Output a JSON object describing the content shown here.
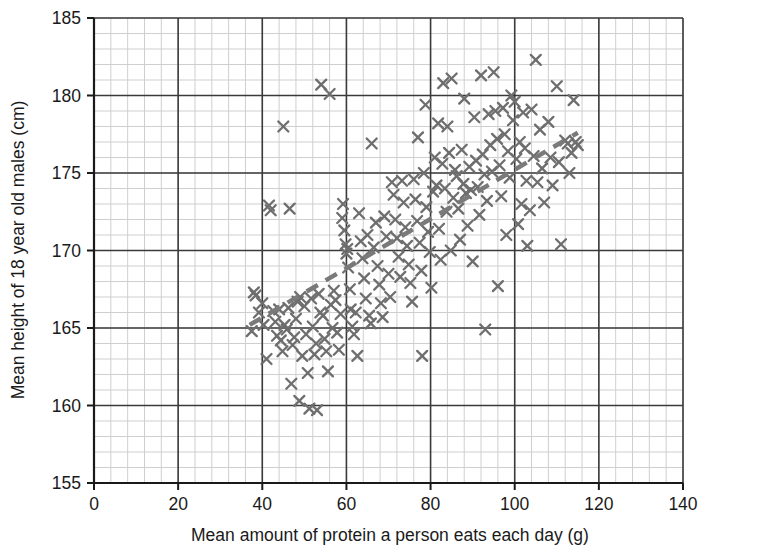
{
  "chart_data": {
    "type": "scatter",
    "title": "",
    "xlabel": "Mean amount of protein a person eats each day (g)",
    "ylabel": "Mean height of 18 year old males (cm)",
    "xlim": [
      0,
      140
    ],
    "ylim": [
      155,
      185
    ],
    "x_major_ticks": [
      0,
      20,
      40,
      60,
      80,
      100,
      120,
      140
    ],
    "y_major_ticks": [
      155,
      160,
      165,
      170,
      175,
      180,
      185
    ],
    "x_minor_step": 4,
    "y_minor_step": 1,
    "grid": true,
    "legend": "none",
    "marker": "x-cross",
    "marker_color": "#6e6e6e",
    "grid_major_color": "#3a3a3a",
    "grid_minor_color": "#cfcfcf",
    "axis_color": "#1a1a1a",
    "trend_line": {
      "style": "dashed",
      "color": "#7a7a7a",
      "width": 4.5,
      "x_start": 37,
      "y_start": 165.2,
      "x_end": 115,
      "y_end": 177.6
    },
    "points": [
      [
        37.5,
        164.8
      ],
      [
        38.0,
        167.3
      ],
      [
        38.4,
        167.1
      ],
      [
        39.2,
        166.0
      ],
      [
        40.0,
        166.6
      ],
      [
        40.3,
        165.2
      ],
      [
        41.0,
        163.0
      ],
      [
        41.6,
        172.9
      ],
      [
        42.0,
        172.6
      ],
      [
        42.6,
        166.1
      ],
      [
        43.1,
        165.4
      ],
      [
        43.5,
        164.5
      ],
      [
        44.0,
        166.2
      ],
      [
        44.4,
        164.2
      ],
      [
        44.8,
        163.5
      ],
      [
        45.0,
        178.0
      ],
      [
        45.3,
        165.2
      ],
      [
        45.8,
        164.9
      ],
      [
        46.2,
        166.3
      ],
      [
        46.5,
        172.7
      ],
      [
        46.9,
        161.4
      ],
      [
        47.2,
        163.9
      ],
      [
        47.6,
        164.4
      ],
      [
        48.0,
        165.6
      ],
      [
        48.4,
        166.7
      ],
      [
        48.8,
        160.3
      ],
      [
        49.0,
        167.0
      ],
      [
        49.5,
        163.2
      ],
      [
        50.0,
        166.4
      ],
      [
        50.4,
        164.6
      ],
      [
        50.8,
        162.1
      ],
      [
        51.2,
        159.8
      ],
      [
        51.6,
        166.9
      ],
      [
        52.0,
        165.1
      ],
      [
        52.4,
        163.3
      ],
      [
        52.8,
        164.0
      ],
      [
        53.0,
        159.7
      ],
      [
        53.4,
        167.2
      ],
      [
        53.8,
        166.0
      ],
      [
        54.0,
        180.7
      ],
      [
        54.4,
        165.8
      ],
      [
        54.8,
        164.3
      ],
      [
        55.2,
        163.5
      ],
      [
        55.6,
        162.2
      ],
      [
        56.0,
        180.1
      ],
      [
        56.3,
        166.5
      ],
      [
        56.7,
        165.0
      ],
      [
        57.0,
        167.4
      ],
      [
        57.4,
        166.8
      ],
      [
        57.8,
        164.7
      ],
      [
        58.2,
        163.6
      ],
      [
        58.6,
        165.9
      ],
      [
        59.0,
        172.1
      ],
      [
        59.2,
        173.0
      ],
      [
        59.5,
        171.3
      ],
      [
        59.8,
        170.4
      ],
      [
        60.0,
        169.8
      ],
      [
        60.2,
        170.1
      ],
      [
        60.4,
        168.9
      ],
      [
        60.8,
        167.5
      ],
      [
        61.0,
        166.2
      ],
      [
        61.4,
        165.1
      ],
      [
        61.8,
        164.6
      ],
      [
        62.2,
        166.0
      ],
      [
        62.6,
        163.2
      ],
      [
        63.0,
        172.4
      ],
      [
        63.4,
        170.6
      ],
      [
        63.8,
        169.5
      ],
      [
        64.2,
        168.2
      ],
      [
        64.6,
        166.9
      ],
      [
        65.0,
        171.0
      ],
      [
        65.4,
        165.8
      ],
      [
        65.8,
        165.3
      ],
      [
        66.0,
        176.9
      ],
      [
        66.5,
        170.2
      ],
      [
        67.0,
        171.8
      ],
      [
        67.4,
        169.0
      ],
      [
        67.8,
        167.8
      ],
      [
        68.2,
        166.6
      ],
      [
        68.6,
        165.7
      ],
      [
        69.0,
        172.2
      ],
      [
        69.5,
        170.9
      ],
      [
        70.0,
        168.5
      ],
      [
        70.4,
        167.0
      ],
      [
        70.8,
        174.4
      ],
      [
        71.2,
        173.6
      ],
      [
        71.6,
        172.0
      ],
      [
        72.0,
        170.8
      ],
      [
        72.4,
        169.6
      ],
      [
        72.8,
        168.3
      ],
      [
        73.2,
        174.5
      ],
      [
        73.6,
        173.1
      ],
      [
        74.0,
        171.5
      ],
      [
        74.4,
        170.3
      ],
      [
        74.8,
        169.1
      ],
      [
        75.2,
        167.9
      ],
      [
        75.6,
        166.7
      ],
      [
        76.0,
        174.6
      ],
      [
        76.4,
        173.3
      ],
      [
        76.8,
        171.9
      ],
      [
        77.0,
        177.3
      ],
      [
        77.4,
        170.5
      ],
      [
        77.8,
        168.7
      ],
      [
        78.0,
        163.2
      ],
      [
        78.4,
        175.0
      ],
      [
        78.8,
        179.4
      ],
      [
        79.0,
        172.8
      ],
      [
        79.4,
        171.2
      ],
      [
        79.8,
        169.9
      ],
      [
        80.2,
        167.6
      ],
      [
        80.6,
        173.8
      ],
      [
        81.0,
        176.0
      ],
      [
        81.4,
        174.2
      ],
      [
        81.8,
        178.2
      ],
      [
        82.0,
        171.4
      ],
      [
        82.4,
        169.4
      ],
      [
        82.8,
        175.6
      ],
      [
        83.0,
        180.8
      ],
      [
        83.4,
        174.0
      ],
      [
        83.8,
        172.5
      ],
      [
        84.0,
        178.0
      ],
      [
        84.4,
        176.3
      ],
      [
        84.8,
        170.0
      ],
      [
        85.0,
        181.1
      ],
      [
        85.4,
        173.4
      ],
      [
        85.8,
        175.2
      ],
      [
        86.2,
        174.8
      ],
      [
        86.6,
        172.7
      ],
      [
        87.0,
        170.7
      ],
      [
        87.4,
        176.5
      ],
      [
        87.8,
        174.3
      ],
      [
        88.0,
        179.8
      ],
      [
        88.4,
        173.7
      ],
      [
        88.8,
        171.6
      ],
      [
        89.2,
        175.4
      ],
      [
        89.6,
        173.9
      ],
      [
        90.0,
        169.3
      ],
      [
        90.4,
        178.6
      ],
      [
        90.8,
        175.8
      ],
      [
        91.2,
        174.1
      ],
      [
        91.6,
        172.3
      ],
      [
        92.0,
        181.3
      ],
      [
        92.4,
        176.2
      ],
      [
        92.8,
        174.9
      ],
      [
        93.0,
        164.9
      ],
      [
        93.4,
        173.2
      ],
      [
        93.8,
        178.8
      ],
      [
        94.2,
        176.8
      ],
      [
        94.6,
        175.1
      ],
      [
        95.0,
        181.5
      ],
      [
        95.4,
        179.0
      ],
      [
        95.8,
        177.2
      ],
      [
        96.0,
        167.7
      ],
      [
        96.4,
        175.5
      ],
      [
        96.8,
        173.5
      ],
      [
        97.2,
        179.2
      ],
      [
        97.6,
        177.5
      ],
      [
        98.0,
        171.0
      ],
      [
        98.4,
        176.4
      ],
      [
        98.8,
        174.7
      ],
      [
        99.2,
        180.0
      ],
      [
        99.6,
        178.4
      ],
      [
        100.0,
        179.6
      ],
      [
        100.4,
        175.9
      ],
      [
        100.8,
        171.7
      ],
      [
        101.2,
        177.0
      ],
      [
        101.6,
        173.0
      ],
      [
        102.0,
        178.9
      ],
      [
        102.4,
        176.6
      ],
      [
        102.8,
        174.5
      ],
      [
        103.0,
        170.3
      ],
      [
        103.6,
        172.6
      ],
      [
        104.0,
        179.1
      ],
      [
        104.5,
        176.1
      ],
      [
        105.0,
        182.3
      ],
      [
        105.4,
        174.4
      ],
      [
        106.0,
        177.8
      ],
      [
        106.5,
        175.3
      ],
      [
        107.0,
        173.1
      ],
      [
        108.0,
        178.3
      ],
      [
        108.5,
        176.0
      ],
      [
        109.0,
        174.2
      ],
      [
        110.0,
        180.6
      ],
      [
        110.5,
        175.7
      ],
      [
        111.0,
        170.4
      ],
      [
        112.0,
        177.1
      ],
      [
        112.6,
        176.9
      ],
      [
        113.0,
        175.0
      ],
      [
        113.5,
        176.3
      ],
      [
        114.0,
        179.7
      ],
      [
        114.5,
        177.0
      ],
      [
        115.0,
        176.8
      ]
    ]
  }
}
